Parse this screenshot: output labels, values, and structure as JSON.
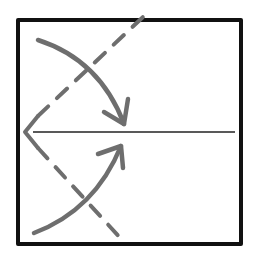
{
  "diagram": {
    "type": "origami-fold-instruction",
    "colors": {
      "paper_outline": "#111111",
      "crease_line": "#222222",
      "fold_line": "#6e6e6e",
      "arrow": "#6e6e6e",
      "background": "#ffffff"
    },
    "elements": [
      {
        "name": "paper-square",
        "kind": "outline"
      },
      {
        "name": "center-crease",
        "kind": "solid-line",
        "orientation": "horizontal"
      },
      {
        "name": "upper-fold-line",
        "kind": "dashed-line",
        "from": "left-edge-midpoint",
        "to": "top-edge"
      },
      {
        "name": "lower-fold-line",
        "kind": "dashed-line",
        "from": "left-edge-midpoint",
        "to": "bottom-edge"
      },
      {
        "name": "upper-fold-arrow",
        "kind": "curved-arrow",
        "from": "top-left-corner",
        "to": "center-line"
      },
      {
        "name": "lower-fold-arrow",
        "kind": "curved-arrow",
        "from": "bottom-left-corner",
        "to": "center-line"
      }
    ]
  }
}
